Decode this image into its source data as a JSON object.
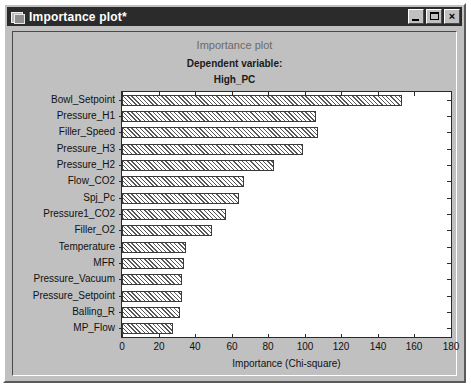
{
  "window": {
    "title": "Importance plot*",
    "icon": "plot-window-icon",
    "buttons": {
      "minimize": "_",
      "maximize": "□",
      "close": "×"
    }
  },
  "chart_data": {
    "type": "bar",
    "orientation": "horizontal",
    "title": "Importance plot",
    "subtitle_label": "Dependent variable:",
    "subtitle_value": "High_PC",
    "xlabel": "Importance (Chi-square)",
    "ylabel": "",
    "xlim": [
      0,
      180
    ],
    "xticks": [
      0,
      20,
      40,
      60,
      80,
      100,
      120,
      140,
      160,
      180
    ],
    "grid": false,
    "legend": "none",
    "bar_fill": "diagonal-hatch",
    "categories": [
      "Bowl_Setpoint",
      "Pressure_H1",
      "Filler_Speed",
      "Pressure_H3",
      "Pressure_H2",
      "Flow_CO2",
      "Spj_Pc",
      "Pressure1_CO2",
      "Filler_O2",
      "Temperature",
      "MFR",
      "Pressure_Vacuum",
      "Pressure_Setpoint",
      "Balling_R",
      "MP_Flow"
    ],
    "values": [
      153,
      106,
      107,
      99,
      83,
      67,
      64,
      57,
      49,
      35,
      34,
      33,
      33,
      32,
      28
    ]
  }
}
